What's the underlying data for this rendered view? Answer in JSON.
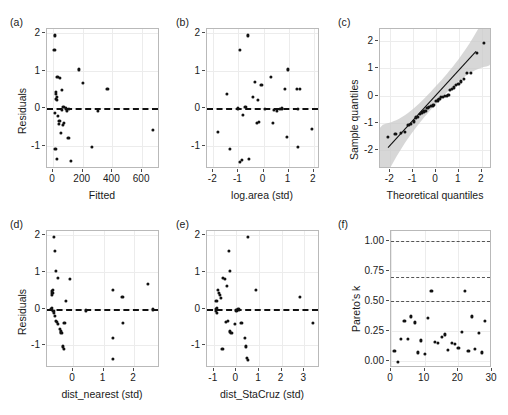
{
  "figure": {
    "width": 508,
    "height": 415,
    "background": "#ffffff",
    "point_color": "#111111",
    "grid_color": "#ececec",
    "frame_color": "#b9b9b9",
    "band_color": "#c9c9c9"
  },
  "panels": [
    {
      "tag": "(a)"
    },
    {
      "tag": "(b)"
    },
    {
      "tag": "(c)"
    },
    {
      "tag": "(d)"
    },
    {
      "tag": "(e)"
    },
    {
      "tag": "(f)"
    }
  ],
  "chart_data": [
    {
      "type": "scatter",
      "panel": "(a)",
      "title": "",
      "xlabel": "Fitted",
      "ylabel": "Residuals",
      "xlim": [
        -40,
        720
      ],
      "ylim": [
        -1.62,
        2.12
      ],
      "xticks": [
        0,
        200,
        400,
        600
      ],
      "xticklabels": [
        "0",
        "200",
        "400",
        "600"
      ],
      "yticks": [
        -1,
        0,
        1,
        2
      ],
      "yticklabels": [
        "-1",
        "0",
        "1",
        "2"
      ],
      "grid": true,
      "reference_lines": [
        {
          "orientation": "horizontal",
          "y": 0,
          "style": "dashed"
        }
      ],
      "x": [
        14,
        10,
        30,
        46,
        60,
        20,
        22,
        24,
        18,
        26,
        70,
        86,
        58,
        12,
        34,
        44,
        74,
        96,
        110,
        40,
        52,
        68,
        104,
        16,
        28,
        120,
        172,
        200,
        262,
        300,
        366,
        672
      ],
      "y": [
        1.95,
        1.57,
        0.84,
        0.82,
        0.5,
        0.44,
        0.38,
        0.3,
        0.26,
        0.22,
        0.03,
        0.0,
        -0.05,
        -0.12,
        -0.2,
        -0.33,
        -0.38,
        -0.06,
        -0.02,
        -0.42,
        -0.66,
        -0.44,
        -0.8,
        -1.09,
        -1.35,
        -1.4,
        1.04,
        0.67,
        -1.03,
        -0.06,
        0.52,
        -0.58
      ]
    },
    {
      "type": "scatter",
      "panel": "(b)",
      "title": "",
      "xlabel": "log.area (std)",
      "ylabel": "",
      "xlim": [
        -2.25,
        2.25
      ],
      "ylim": [
        -1.62,
        2.12
      ],
      "xticks": [
        -2,
        -1,
        0,
        1,
        2
      ],
      "xticklabels": [
        "-2",
        "-1",
        "0",
        "1",
        "2"
      ],
      "yticks": [
        -1,
        0,
        1,
        2
      ],
      "yticklabels": [
        "-1",
        "0",
        "1",
        "2"
      ],
      "grid": true,
      "reference_lines": [
        {
          "orientation": "horizontal",
          "y": 0,
          "style": "dashed"
        }
      ],
      "x": [
        -0.63,
        -0.95,
        -0.22,
        0.97,
        -0.08,
        0.31,
        1.32,
        -0.42,
        1.46,
        -0.33,
        -1.45,
        -0.72,
        0.64,
        0.72,
        0.84,
        0.55,
        1.36,
        -0.82,
        -0.27,
        -0.18,
        0.37,
        -1.8,
        -1.33,
        0.93,
        1.38,
        1.94,
        -0.93,
        -0.87,
        -0.58,
        -1.02,
        0.05,
        0.42
      ],
      "y": [
        1.95,
        1.57,
        0.22,
        1.04,
        0.62,
        0.84,
        0.52,
        0.3,
        0.52,
        0.7,
        0.38,
        0.03,
        -0.02,
        0.0,
        0.52,
        -0.06,
        -0.02,
        -0.18,
        -0.38,
        -0.36,
        -0.38,
        -0.62,
        -1.09,
        -0.77,
        -1.03,
        -0.55,
        -1.42,
        -1.38,
        -1.35,
        0.0,
        -0.02,
        -0.05
      ]
    },
    {
      "type": "scatter",
      "panel": "(c)",
      "title": "",
      "xlabel": "Theoretical quantiles",
      "ylabel": "Sample quantiles",
      "xlim": [
        -2.45,
        2.45
      ],
      "ylim": [
        -2.7,
        2.45
      ],
      "xticks": [
        -2,
        -1,
        0,
        1,
        2
      ],
      "xticklabels": [
        "-2",
        "-1",
        "0",
        "1",
        "2"
      ],
      "yticks": [
        -2,
        -1,
        0,
        1,
        2
      ],
      "yticklabels": [
        "-2",
        "-1",
        "0",
        "1",
        "2"
      ],
      "grid": true,
      "qq_line": {
        "slope": 0.92,
        "intercept": 0.02
      },
      "confidence_band": true,
      "band_halfwidth_center": 0.33,
      "band_halfwidth_edge": 1.05,
      "x": [
        -2.1,
        -1.78,
        -1.52,
        -1.35,
        -1.21,
        -1.09,
        -0.98,
        -0.88,
        -0.79,
        -0.7,
        -0.62,
        -0.54,
        -0.46,
        -0.38,
        -0.31,
        -0.23,
        -0.15,
        -0.08,
        0.0,
        0.08,
        0.15,
        0.23,
        0.31,
        0.38,
        0.46,
        0.54,
        0.62,
        0.7,
        0.79,
        0.88,
        0.98,
        1.09,
        1.21,
        1.35,
        1.52,
        1.78,
        2.1
      ],
      "y": [
        -1.52,
        -1.42,
        -1.38,
        -1.35,
        -1.09,
        -1.03,
        -0.95,
        -0.8,
        -0.77,
        -0.66,
        -0.62,
        -0.58,
        -0.55,
        -0.44,
        -0.42,
        -0.38,
        -0.36,
        -0.33,
        -0.2,
        -0.18,
        -0.12,
        -0.06,
        -0.05,
        -0.02,
        0.0,
        0.03,
        0.22,
        0.26,
        0.3,
        0.38,
        0.44,
        0.52,
        0.62,
        0.84,
        0.82,
        1.57,
        1.95
      ]
    },
    {
      "type": "scatter",
      "panel": "(d)",
      "title": "",
      "xlabel": "dist_nearest (std)",
      "ylabel": "Residuals",
      "xlim": [
        -0.85,
        2.85
      ],
      "ylim": [
        -1.62,
        2.12
      ],
      "xticks": [
        0,
        1,
        2
      ],
      "xticklabels": [
        "0",
        "1",
        "2"
      ],
      "yticks": [
        -1,
        0,
        1,
        2
      ],
      "yticklabels": [
        "-1",
        "0",
        "1",
        "2"
      ],
      "grid": true,
      "reference_lines": [
        {
          "orientation": "horizontal",
          "y": 0,
          "style": "dashed"
        }
      ],
      "x": [
        -0.62,
        -0.6,
        -0.55,
        -0.5,
        -0.66,
        -0.68,
        -0.67,
        -0.7,
        -0.7,
        -0.71,
        -0.64,
        -0.63,
        -0.58,
        -0.56,
        -0.52,
        -0.48,
        -0.44,
        -0.4,
        -0.38,
        -0.34,
        -0.3,
        -0.28,
        -0.22,
        -0.1,
        0.42,
        1.3,
        1.3,
        1.32,
        1.62,
        1.63,
        2.45,
        2.62
      ],
      "y": [
        1.95,
        1.57,
        1.04,
        0.84,
        0.52,
        0.48,
        0.44,
        0.38,
        0.03,
        0.0,
        -0.06,
        -0.12,
        -0.2,
        -0.33,
        -0.36,
        -0.42,
        -0.55,
        -0.62,
        -0.66,
        -1.03,
        -1.09,
        -0.38,
        0.22,
        0.82,
        -0.05,
        0.52,
        -0.8,
        -1.38,
        0.31,
        -0.4,
        0.67,
        -0.02
      ]
    },
    {
      "type": "scatter",
      "panel": "(e)",
      "title": "",
      "xlabel": "dist_StaCruz (std)",
      "ylabel": "",
      "xlim": [
        -1.3,
        3.7
      ],
      "ylim": [
        -1.62,
        2.12
      ],
      "xticks": [
        -1,
        0,
        1,
        2,
        3
      ],
      "xticklabels": [
        "-1",
        "0",
        "1",
        "2",
        "3"
      ],
      "yticks": [
        -1,
        0,
        1,
        2
      ],
      "yticklabels": [
        "-1",
        "0",
        "1",
        "2"
      ],
      "grid": true,
      "reference_lines": [
        {
          "orientation": "horizontal",
          "y": 0,
          "style": "dashed"
        }
      ],
      "x": [
        0.5,
        -0.32,
        -0.3,
        -0.58,
        -0.52,
        -0.82,
        -0.78,
        -0.72,
        -0.68,
        -0.88,
        -0.86,
        -0.9,
        -0.92,
        -0.85,
        -0.62,
        -0.48,
        -0.42,
        -0.36,
        -0.3,
        -0.22,
        -0.08,
        0.0,
        0.05,
        0.1,
        0.22,
        0.38,
        0.42,
        0.48,
        0.52,
        0.88,
        2.8,
        3.4
      ],
      "y": [
        1.95,
        1.57,
        1.04,
        0.84,
        0.82,
        0.52,
        0.44,
        0.38,
        0.3,
        0.22,
        0.03,
        0.0,
        -0.06,
        -0.12,
        -1.09,
        -0.36,
        0.62,
        -0.33,
        -0.62,
        -0.66,
        -0.42,
        -0.05,
        0.0,
        -0.02,
        -0.38,
        -0.8,
        -1.03,
        -1.35,
        -1.4,
        0.52,
        0.31,
        -0.38
      ]
    },
    {
      "type": "scatter",
      "panel": "(f)",
      "title": "",
      "xlabel": "",
      "ylabel": "Pareto's k",
      "xlim": [
        0,
        30
      ],
      "ylim": [
        -0.06,
        1.08
      ],
      "xticks": [
        0,
        10,
        20,
        30
      ],
      "xticklabels": [
        "0",
        "10",
        "20",
        "30"
      ],
      "yticks": [
        0.0,
        0.25,
        0.5,
        0.75,
        1.0
      ],
      "yticklabels": [
        "0.00",
        "0.25",
        "0.50",
        "0.75",
        "1.00"
      ],
      "grid": true,
      "reference_lines": [
        {
          "orientation": "horizontal",
          "y": 0.5,
          "style": "dashed"
        },
        {
          "orientation": "horizontal",
          "y": 0.7,
          "style": "dashed"
        },
        {
          "orientation": "horizontal",
          "y": 1.0,
          "style": "dashed"
        }
      ],
      "x": [
        1,
        2,
        3,
        4,
        5,
        6,
        7,
        8,
        9,
        10,
        11,
        12,
        13,
        14,
        15,
        16,
        17,
        18,
        19,
        20,
        21,
        22,
        23,
        24,
        25,
        26,
        27,
        28
      ],
      "y": [
        0.08,
        -0.01,
        0.18,
        0.33,
        0.18,
        0.37,
        0.32,
        0.07,
        0.17,
        0.06,
        0.36,
        0.58,
        0.16,
        0.15,
        0.2,
        0.22,
        0.09,
        0.15,
        0.14,
        0.11,
        0.24,
        0.58,
        0.08,
        0.37,
        0.1,
        0.23,
        0.07,
        0.33
      ]
    }
  ]
}
